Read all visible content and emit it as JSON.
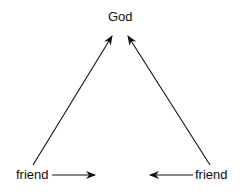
{
  "diagram": {
    "nodes": {
      "top": {
        "label": "God"
      },
      "left": {
        "label": "friend"
      },
      "right": {
        "label": "friend"
      }
    },
    "edges": [
      {
        "from": "left",
        "to": "top"
      },
      {
        "from": "right",
        "to": "top"
      },
      {
        "from": "left",
        "to": "center",
        "note": "horizontal arrow pointing right, not reaching"
      },
      {
        "from": "right",
        "to": "center",
        "note": "horizontal arrow pointing left, not reaching"
      }
    ]
  }
}
